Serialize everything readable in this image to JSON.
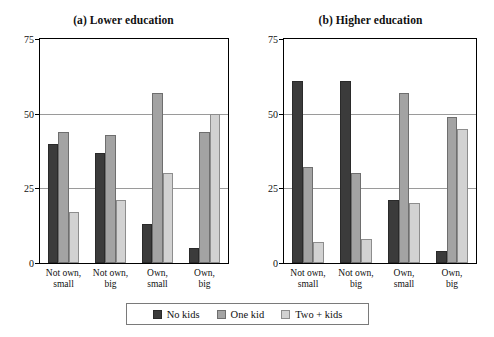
{
  "figure": {
    "background": "#ffffff"
  },
  "legend": {
    "position": "bottom-center",
    "entries": [
      {
        "label": "No kids",
        "color": "#3b3b3b"
      },
      {
        "label": "One kid",
        "color": "#a3a3a3"
      },
      {
        "label": "Two + kids",
        "color": "#d2d2d2"
      }
    ]
  },
  "chart_data": [
    {
      "type": "bar",
      "title": "(a) Lower education",
      "panel": "a",
      "xlabel": "",
      "ylabel": "",
      "ylim": [
        0,
        75
      ],
      "yticks": [
        0,
        25,
        50,
        75
      ],
      "ytick_labels": [
        "0",
        "25",
        "50",
        "75"
      ],
      "grid": true,
      "legend_position": "bottom-center",
      "categories": [
        "Not own, small",
        "Not own, big",
        "Own, small",
        "Own, big"
      ],
      "category_lines": [
        [
          "Not own,",
          "small"
        ],
        [
          "Not own,",
          "big"
        ],
        [
          "Own,",
          "small"
        ],
        [
          "Own,",
          "big"
        ]
      ],
      "series": [
        {
          "name": "No kids",
          "color": "#3b3b3b",
          "values": [
            40,
            37,
            13,
            5
          ]
        },
        {
          "name": "One kid",
          "color": "#a3a3a3",
          "values": [
            44,
            43,
            57,
            44
          ]
        },
        {
          "name": "Two + kids",
          "color": "#d2d2d2",
          "values": [
            17,
            21,
            30,
            50
          ]
        }
      ]
    },
    {
      "type": "bar",
      "title": "(b) Higher education",
      "panel": "b",
      "xlabel": "",
      "ylabel": "",
      "ylim": [
        0,
        75
      ],
      "yticks": [
        0,
        25,
        50,
        75
      ],
      "ytick_labels": [
        "0",
        "25",
        "50",
        "75"
      ],
      "grid": true,
      "legend_position": "bottom-center",
      "categories": [
        "Not own, small",
        "Not own, big",
        "Own, small",
        "Own, big"
      ],
      "category_lines": [
        [
          "Not own,",
          "small"
        ],
        [
          "Not own,",
          "big"
        ],
        [
          "Own,",
          "small"
        ],
        [
          "Own,",
          "big"
        ]
      ],
      "series": [
        {
          "name": "No kids",
          "color": "#3b3b3b",
          "values": [
            61,
            61,
            21,
            4
          ]
        },
        {
          "name": "One kid",
          "color": "#a3a3a3",
          "values": [
            32,
            30,
            57,
            49
          ]
        },
        {
          "name": "Two + kids",
          "color": "#d2d2d2",
          "values": [
            7,
            8,
            20,
            45
          ]
        }
      ]
    }
  ]
}
